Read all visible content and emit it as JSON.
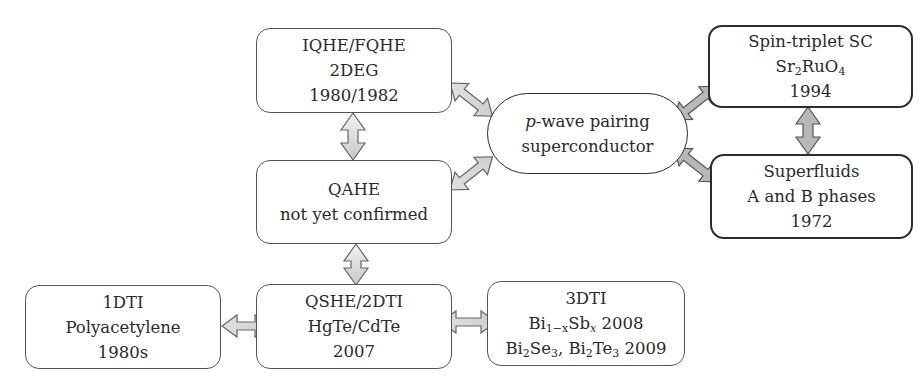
{
  "diagram": {
    "nodes": {
      "iqhe": {
        "lines": [
          "IQHE/FQHE",
          "2DEG",
          "1980/1982"
        ]
      },
      "qahe": {
        "lines": [
          "QAHE",
          "not yet confirmed"
        ]
      },
      "qshe": {
        "lines": [
          "QSHE/2DTI",
          "HgTe/CdTe",
          "2007"
        ]
      },
      "dti1": {
        "lines": [
          "1DTI",
          "Polyacetylene",
          "1980s"
        ]
      },
      "dti3": {
        "title": "3DTI",
        "line2": {
          "el1": "Bi",
          "sub1": "1−x",
          "el2": "Sb",
          "sub2": "x",
          "year": "2008"
        },
        "line3": {
          "el1": "Bi",
          "sub1": "2",
          "el2": "Se",
          "sub2": "3",
          "sep": ", ",
          "el3": "Bi",
          "sub3": "2",
          "el4": "Te",
          "sub4": "3",
          "year": "2009"
        }
      },
      "pwave": {
        "italic": "p",
        "line1_rest": "-wave pairing",
        "line2": "superconductor"
      },
      "spin_triplet": {
        "title": "Spin-triplet SC",
        "formula": {
          "el1": "Sr",
          "sub1": "2",
          "el2": "RuO",
          "sub2": "4"
        },
        "year": "1994"
      },
      "superfluids": {
        "lines": [
          "Superfluids",
          "A and B phases",
          "1972"
        ]
      }
    },
    "edges": [
      {
        "from": "iqhe",
        "to": "qahe",
        "style": "light"
      },
      {
        "from": "qahe",
        "to": "qshe",
        "style": "light"
      },
      {
        "from": "dti1",
        "to": "qshe",
        "style": "light"
      },
      {
        "from": "qshe",
        "to": "dti3",
        "style": "light"
      },
      {
        "from": "iqhe",
        "to": "pwave",
        "style": "light"
      },
      {
        "from": "qahe",
        "to": "pwave",
        "style": "light"
      },
      {
        "from": "spin_triplet",
        "to": "pwave",
        "style": "dark"
      },
      {
        "from": "superfluids",
        "to": "pwave",
        "style": "dark"
      },
      {
        "from": "spin_triplet",
        "to": "superfluids",
        "style": "dark"
      }
    ],
    "colors": {
      "light_arrow_fill": "#e6e6e6",
      "dark_arrow_fill": "#b8b8b8",
      "arrow_stroke": "#555555",
      "border": "#444444"
    }
  }
}
